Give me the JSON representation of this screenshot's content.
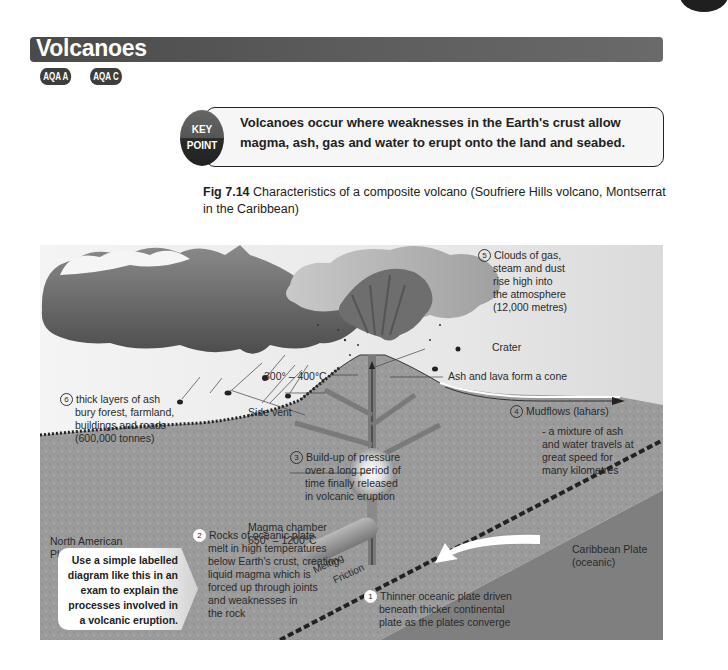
{
  "header": {
    "title": "Volcanoes",
    "badges": [
      "AQA A",
      "AQA C"
    ]
  },
  "key_point": {
    "icon_line1": "KEY",
    "icon_line2": "POINT",
    "text": "Volcanoes occur where weaknesses in the Earth's crust allow magma, ash, gas and water to erupt onto the land and seabed."
  },
  "figure": {
    "number": "Fig 7.14",
    "caption": "Characteristics of a composite volcano (Soufriere Hills volcano, Montserrat in the Caribbean)"
  },
  "diagram": {
    "labels": {
      "clouds": {
        "num": "5",
        "lines": [
          "Clouds of gas,",
          "steam and dust",
          "rise high into",
          "the atmosphere",
          "(12,000 metres)"
        ]
      },
      "crater": "Crater",
      "temperature_cone": "300° – 400°C",
      "cone": "Ash and lava form a cone",
      "ash_layers": {
        "num": "6",
        "lines": [
          "thick layers of ash",
          "bury forest, farmland,",
          "buildings and roads",
          "(600,000 tonnes)"
        ]
      },
      "side_vent": "Side vent",
      "mudflows": {
        "num": "4",
        "title": "Mudflows (lahars)",
        "lines": [
          "- a mixture of ash",
          "and water travels at",
          "great speed for",
          "many kilometres"
        ]
      },
      "pressure": {
        "num": "3",
        "lines": [
          "Build-up of pressure",
          "over a long period of",
          "time finally released",
          "in volcanic eruption"
        ]
      },
      "magma_chamber": {
        "lines": [
          "Magma chamber",
          "650° – 1200°C"
        ]
      },
      "north_american": {
        "lines": [
          "North American",
          "Plate (continental)"
        ]
      },
      "caribbean": {
        "lines": [
          "Caribbean Plate",
          "(oceanic)"
        ]
      },
      "rocks_melt": {
        "num": "2",
        "lines": [
          "Rocks of oceanic plate",
          "melt in high temperatures",
          "below Earth's crust, creating",
          "liquid magma which is",
          "forced up through joints",
          "and weaknesses in",
          "the rock"
        ]
      },
      "melting": "Melting",
      "friction": "Friction",
      "subduction": {
        "num": "1",
        "lines": [
          "Thinner oceanic plate driven",
          "beneath thicker continental",
          "plate as the plates converge"
        ]
      }
    }
  },
  "exam_tip": {
    "lines": [
      "Use a simple labelled",
      "diagram like this in an",
      "exam to explain the",
      "processes involved in",
      "a volcanic eruption."
    ]
  },
  "colors": {
    "title_bar": "#4f4f4f",
    "land": "#9a9a9a",
    "ocean_plate": "#7f7f7f",
    "cloud_dark": "#555555"
  }
}
